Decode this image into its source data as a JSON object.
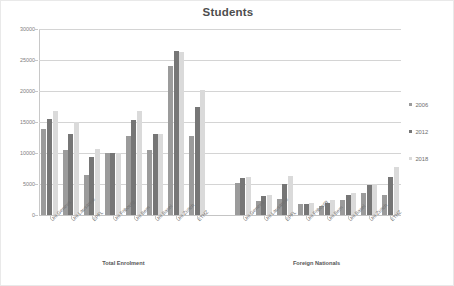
{
  "chart_data": {
    "type": "bar",
    "title": "Students",
    "xlabel": "",
    "ylabel": "",
    "ylim": [
      0,
      30000
    ],
    "yticks": [
      0,
      5000,
      10000,
      15000,
      20000,
      25000,
      30000
    ],
    "ytick_labels": [
      "0",
      "5000",
      "10000",
      "15000",
      "20000",
      "25000",
      "30000"
    ],
    "grid": true,
    "legend_position": "right",
    "legend": [
      "2006",
      "2012",
      "2018"
    ],
    "series_colors": [
      "#9b9b9b",
      "#767676",
      "#dadada"
    ],
    "group_labels": [
      "Total Enrolment",
      "Foreign Nationals"
    ],
    "categories": [
      "Uni Geneva",
      "Uni Lausanne",
      "EPFL",
      "Uni Fribourg",
      "Uni Bern",
      "Uni Basel",
      "Uni Zurich",
      "ETHZ",
      "Uni Geneva",
      "Uni Lausanne",
      "EPFL",
      "Uni Fribourg",
      "Uni Bern",
      "Uni Basel",
      "Uni Zurich",
      "ETHZ"
    ],
    "series": [
      {
        "name": "2006",
        "values": [
          13900,
          10500,
          6500,
          10000,
          12800,
          10500,
          24000,
          12700,
          5100,
          2200,
          2650,
          1800,
          1400,
          2400,
          3500,
          3300
        ]
      },
      {
        "name": "2012",
        "values": [
          15500,
          13000,
          9300,
          10000,
          15400,
          13000,
          26400,
          17400,
          6000,
          3000,
          5000,
          1850,
          2000,
          3300,
          4800,
          6200
        ]
      },
      {
        "name": "2018",
        "values": [
          16800,
          15000,
          10600,
          10050,
          16800,
          13100,
          26300,
          20100,
          6100,
          3300,
          6300,
          1900,
          2350,
          3600,
          5000,
          7800
        ]
      }
    ]
  },
  "legend": {
    "items": [
      {
        "label": "2006",
        "color": "#9b9b9b"
      },
      {
        "label": "2012",
        "color": "#767676"
      },
      {
        "label": "2018",
        "color": "#dadada"
      }
    ]
  },
  "title": "Students",
  "groups": [
    {
      "label": "Total Enrolment"
    },
    {
      "label": "Foreign Nationals"
    }
  ]
}
